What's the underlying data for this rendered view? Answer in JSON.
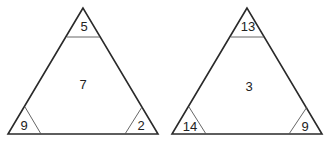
{
  "triangles": [
    {
      "top": "5",
      "center": "7",
      "bottom_left": "9",
      "bottom_right": "2"
    },
    {
      "top": "13",
      "center": "3",
      "bottom_left": "14",
      "bottom_right": "9"
    }
  ]
}
